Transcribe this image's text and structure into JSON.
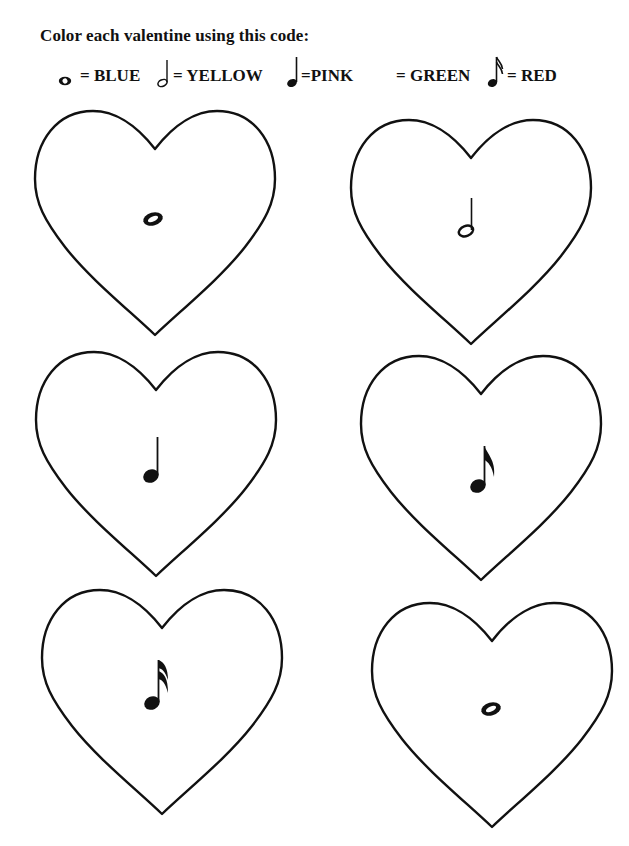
{
  "worksheet": {
    "title": "Color each valentine using this code:"
  },
  "legend": [
    {
      "symbol": "whole-note-icon",
      "text": "= BLUE",
      "color_name": "BLUE"
    },
    {
      "symbol": "half-note-icon",
      "text": "= YELLOW",
      "color_name": "YELLOW"
    },
    {
      "symbol": "quarter-note-icon",
      "text": "=PINK",
      "color_name": "PINK"
    },
    {
      "symbol": "blank",
      "text": "= GREEN",
      "color_name": "GREEN"
    },
    {
      "symbol": "sixteenth-note-icon",
      "text": "= RED",
      "color_name": "RED"
    }
  ],
  "hearts": [
    {
      "position": "row1-left",
      "note": "whole-note"
    },
    {
      "position": "row1-right",
      "note": "half-note"
    },
    {
      "position": "row2-left",
      "note": "quarter-note"
    },
    {
      "position": "row2-right",
      "note": "eighth-note"
    },
    {
      "position": "row3-left",
      "note": "sixteenth-note"
    },
    {
      "position": "row3-right",
      "note": "whole-note"
    }
  ],
  "colors": {
    "outline": "#111111",
    "background": "#ffffff"
  }
}
